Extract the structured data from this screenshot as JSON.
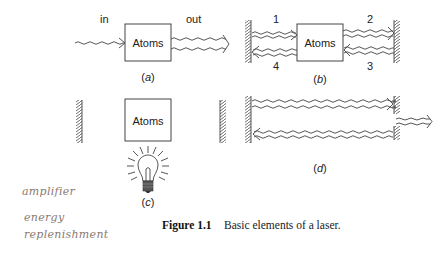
{
  "figure": {
    "caption_label": "Figure 1.1",
    "caption_text": "Basic elements of a laser."
  },
  "panels": {
    "a": {
      "label_open": "(",
      "label_letter": "a",
      "label_close": ")",
      "in_label": "in",
      "out_label": "out",
      "box_label": "Atoms"
    },
    "b": {
      "label_open": "(",
      "label_letter": "b",
      "label_close": ")",
      "box_label": "Atoms",
      "beam_labels": [
        "1",
        "2",
        "3",
        "4"
      ]
    },
    "c": {
      "label_open": "(",
      "label_letter": "c",
      "label_close": ")",
      "box_label": "Atoms"
    },
    "d": {
      "label_open": "(",
      "label_letter": "d",
      "label_close": ")"
    }
  },
  "handwritten_notes": [
    "amplifier",
    "energy",
    "replenishment"
  ],
  "colors": {
    "line": "#444444",
    "text": "#222222",
    "handwriting": "#8a7a70",
    "background": "#ffffff"
  }
}
